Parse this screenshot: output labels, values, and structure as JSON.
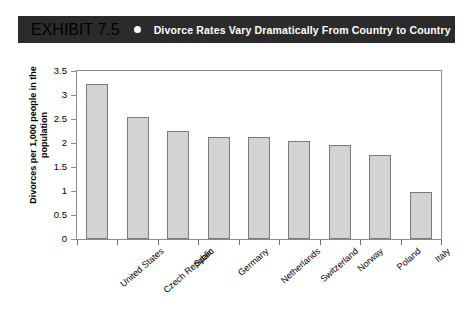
{
  "header": {
    "exhibit_number": "EXHIBIT 7.5",
    "bullet_icon": "bullet-dot-icon",
    "title": "Divorce Rates Vary Dramatically From Country to Country",
    "background_color": "#2b2b2b",
    "text_color": "#ffffff"
  },
  "chart_data": {
    "type": "bar",
    "title": "Divorce Rates Vary Dramatically From Country to Country",
    "xlabel": "",
    "ylabel": "Divorces per 1,000 people in the population",
    "categories": [
      "United States",
      "Czech Republic",
      "Spain",
      "Germany",
      "Netherlands",
      "Switzerland",
      "Norway",
      "Poland",
      "Italy"
    ],
    "values": [
      3.23,
      2.54,
      2.24,
      2.13,
      2.13,
      2.04,
      1.95,
      1.75,
      0.97
    ],
    "ylim": [
      0,
      3.5
    ],
    "yticks": [
      0,
      0.5,
      1,
      1.5,
      2,
      2.5,
      3,
      3.5
    ],
    "ytick_labels": [
      "0",
      "0.5",
      "1",
      "1.5",
      "2",
      "2.5",
      "3",
      "3.5"
    ],
    "grid": false,
    "legend": false,
    "bar_color": "#d3d3d3",
    "bar_edge_color": "#7a7a7a",
    "axis_color": "#8c8c8c",
    "background_color": "#ffffff"
  }
}
